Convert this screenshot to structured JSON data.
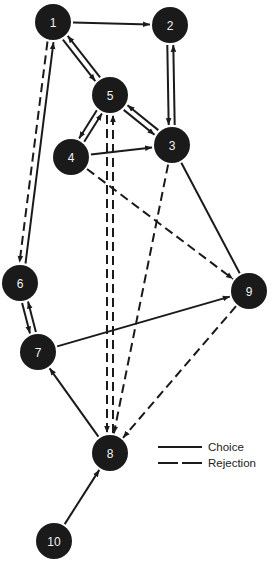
{
  "diagram": {
    "title": "",
    "colors": {
      "node_fill": "#1a1a1a",
      "node_text": "#f2f2f2",
      "edge": "#1a1a1a",
      "background": "#ffffff"
    },
    "nodes": [
      {
        "id": "1",
        "label": "1",
        "x": 53,
        "y": 22
      },
      {
        "id": "2",
        "label": "2",
        "x": 170,
        "y": 25
      },
      {
        "id": "3",
        "label": "3",
        "x": 172,
        "y": 145
      },
      {
        "id": "4",
        "label": "4",
        "x": 71,
        "y": 157
      },
      {
        "id": "5",
        "label": "5",
        "x": 110,
        "y": 95
      },
      {
        "id": "6",
        "label": "6",
        "x": 20,
        "y": 283
      },
      {
        "id": "7",
        "label": "7",
        "x": 38,
        "y": 352
      },
      {
        "id": "8",
        "label": "8",
        "x": 110,
        "y": 453
      },
      {
        "id": "9",
        "label": "9",
        "x": 249,
        "y": 291
      },
      {
        "id": "10",
        "label": "10",
        "x": 54,
        "y": 541
      }
    ],
    "edges": [
      {
        "from": "1",
        "to": "2",
        "type": "choice",
        "arrow": true,
        "offset": 0
      },
      {
        "from": "1",
        "to": "5",
        "type": "choice",
        "arrow": true,
        "offset": 3
      },
      {
        "from": "5",
        "to": "1",
        "type": "choice",
        "arrow": true,
        "offset": 3
      },
      {
        "from": "2",
        "to": "3",
        "type": "choice",
        "arrow": true,
        "offset": 3
      },
      {
        "from": "3",
        "to": "2",
        "type": "choice",
        "arrow": true,
        "offset": 3
      },
      {
        "from": "5",
        "to": "3",
        "type": "choice",
        "arrow": true,
        "offset": 3
      },
      {
        "from": "3",
        "to": "5",
        "type": "choice",
        "arrow": true,
        "offset": 3
      },
      {
        "from": "5",
        "to": "4",
        "type": "choice",
        "arrow": true,
        "offset": 3
      },
      {
        "from": "4",
        "to": "5",
        "type": "choice",
        "arrow": true,
        "offset": 3
      },
      {
        "from": "4",
        "to": "3",
        "type": "choice",
        "arrow": true,
        "offset": 0
      },
      {
        "from": "1",
        "to": "6",
        "type": "rejection",
        "arrow": true,
        "offset": 3
      },
      {
        "from": "6",
        "to": "1",
        "type": "choice",
        "arrow": true,
        "offset": 3
      },
      {
        "from": "6",
        "to": "7",
        "type": "choice",
        "arrow": true,
        "offset": 3
      },
      {
        "from": "7",
        "to": "6",
        "type": "choice",
        "arrow": true,
        "offset": 3
      },
      {
        "from": "7",
        "to": "9",
        "type": "choice",
        "arrow": true,
        "offset": 0
      },
      {
        "from": "4",
        "to": "9",
        "type": "rejection",
        "arrow": true,
        "offset": 0
      },
      {
        "from": "3",
        "to": "9",
        "type": "choice",
        "arrow": false,
        "offset": 0
      },
      {
        "from": "5",
        "to": "8",
        "type": "rejection",
        "arrow": true,
        "offset": 3
      },
      {
        "from": "8",
        "to": "5",
        "type": "rejection",
        "arrow": true,
        "offset": 3
      },
      {
        "from": "3",
        "to": "8",
        "type": "rejection",
        "arrow": true,
        "offset": 0
      },
      {
        "from": "9",
        "to": "8",
        "type": "rejection",
        "arrow": true,
        "offset": 0
      },
      {
        "from": "8",
        "to": "7",
        "type": "choice",
        "arrow": true,
        "offset": 0
      },
      {
        "from": "10",
        "to": "8",
        "type": "choice",
        "arrow": true,
        "offset": 0
      }
    ],
    "legend": {
      "items": [
        {
          "label": "Choice",
          "style": "solid"
        },
        {
          "label": "Rejection",
          "style": "dashed"
        }
      ]
    }
  }
}
